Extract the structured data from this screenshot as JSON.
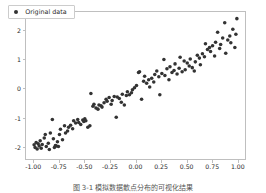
{
  "figure": {
    "background": "#ffffff",
    "axes_edge_color": "#bfbfbf",
    "marker_color": "#333333",
    "caption": "图 3-1  模拟数据散点分布的可视化结果"
  },
  "legend": {
    "label": "Original data",
    "marker": "filled-circle-marker",
    "position": "upper-left"
  },
  "chart_data": {
    "type": "scatter",
    "title": "",
    "xlabel": "",
    "ylabel": "",
    "xlim": [
      -1.08,
      1.08
    ],
    "ylim": [
      -2.45,
      2.65
    ],
    "grid": false,
    "legend_position": "upper left",
    "xticks": [
      -1.0,
      -0.75,
      -0.5,
      -0.25,
      0.0,
      0.25,
      0.5,
      0.75,
      1.0
    ],
    "xtick_labels": [
      "-1.00",
      "-0.75",
      "-0.50",
      "-0.25",
      "0.00",
      "0.25",
      "0.50",
      "0.75",
      "1.00"
    ],
    "yticks": [
      -2,
      -1,
      0,
      1,
      2
    ],
    "ytick_labels": [
      "-2",
      "-1",
      "0",
      "1",
      "2"
    ],
    "series": [
      {
        "name": "Original data",
        "color": "#333333",
        "marker": "o",
        "marker_size": 3.4,
        "x": [
          -1.0,
          -0.99,
          -0.98,
          -0.97,
          -0.96,
          -0.95,
          -0.94,
          -0.93,
          -0.92,
          -0.9,
          -0.89,
          -0.88,
          -0.86,
          -0.85,
          -0.84,
          -0.82,
          -0.81,
          -0.8,
          -0.79,
          -0.78,
          -0.77,
          -0.76,
          -0.75,
          -0.74,
          -0.72,
          -0.7,
          -0.69,
          -0.67,
          -0.66,
          -0.64,
          -0.62,
          -0.61,
          -0.59,
          -0.57,
          -0.56,
          -0.54,
          -0.52,
          -0.51,
          -0.5,
          -0.49,
          -0.47,
          -0.45,
          -0.44,
          -0.42,
          -0.41,
          -0.39,
          -0.37,
          -0.36,
          -0.34,
          -0.33,
          -0.31,
          -0.29,
          -0.28,
          -0.26,
          -0.24,
          -0.23,
          -0.21,
          -0.19,
          -0.18,
          -0.16,
          -0.14,
          -0.13,
          -0.11,
          -0.09,
          -0.08,
          -0.06,
          -0.04,
          -0.03,
          -0.01,
          0.01,
          0.03,
          0.04,
          0.06,
          0.08,
          0.09,
          0.11,
          0.13,
          0.14,
          0.16,
          0.18,
          0.19,
          0.21,
          0.23,
          0.24,
          0.26,
          0.28,
          0.29,
          0.31,
          0.33,
          0.34,
          0.36,
          0.38,
          0.39,
          0.41,
          0.43,
          0.44,
          0.46,
          0.48,
          0.49,
          0.51,
          0.53,
          0.54,
          0.56,
          0.58,
          0.59,
          0.61,
          0.63,
          0.64,
          0.66,
          0.68,
          0.69,
          0.71,
          0.73,
          0.74,
          0.76,
          0.78,
          0.79,
          0.81,
          0.83,
          0.84,
          0.86,
          0.88,
          0.89,
          0.91,
          0.93,
          0.94,
          0.96,
          0.98,
          0.99,
          1.0
        ],
        "y": [
          -1.96,
          -2.05,
          -1.88,
          -2.1,
          -1.92,
          -2.0,
          -1.82,
          -2.08,
          -1.95,
          -1.72,
          -1.6,
          -2.02,
          -1.9,
          -2.12,
          -1.55,
          -1.08,
          -1.75,
          -2.05,
          -1.98,
          -2.0,
          -1.85,
          -2.02,
          -1.6,
          -1.42,
          -1.78,
          -1.3,
          -1.55,
          -1.48,
          -1.35,
          -1.28,
          -1.4,
          -1.12,
          -1.2,
          -1.08,
          -1.18,
          -1.25,
          -1.1,
          -1.15,
          -1.05,
          -1.12,
          -1.35,
          -1.3,
          -0.18,
          -0.62,
          -0.55,
          -0.68,
          -0.72,
          -0.58,
          -0.6,
          -0.65,
          -0.5,
          -0.38,
          -0.45,
          -0.32,
          -0.55,
          -0.42,
          -0.28,
          -1.0,
          -0.3,
          -0.35,
          -0.48,
          -0.2,
          -0.58,
          -0.25,
          -0.12,
          -0.22,
          -0.15,
          -0.05,
          0.02,
          0.1,
          0.55,
          0.58,
          -0.38,
          0.25,
          0.42,
          0.18,
          0.3,
          0.05,
          0.35,
          0.22,
          0.48,
          0.6,
          0.4,
          -0.22,
          0.52,
          1.0,
          0.45,
          0.68,
          0.3,
          0.75,
          0.55,
          0.62,
          0.85,
          0.5,
          0.7,
          1.08,
          0.58,
          0.95,
          0.65,
          0.88,
          0.78,
          1.02,
          0.72,
          0.6,
          0.92,
          1.15,
          1.05,
          0.82,
          1.2,
          1.1,
          1.55,
          1.35,
          1.42,
          1.28,
          1.48,
          1.12,
          1.6,
          1.95,
          1.38,
          1.52,
          1.75,
          2.28,
          1.22,
          1.68,
          1.82,
          1.58,
          2.05,
          1.42,
          1.88,
          2.42
        ]
      }
    ]
  }
}
